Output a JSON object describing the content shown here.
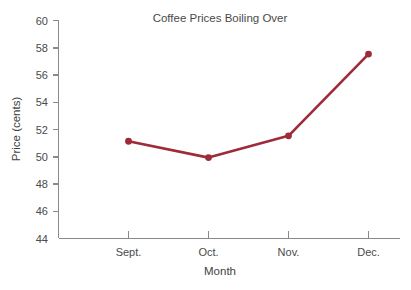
{
  "chart_data": {
    "type": "line",
    "title": "Coffee Prices Boiling Over",
    "xlabel": "Month",
    "ylabel": "Price (cents)",
    "categories": [
      "Sept.",
      "Oct.",
      "Nov.",
      "Dec."
    ],
    "values": [
      51.1,
      49.9,
      51.5,
      57.5
    ],
    "series": [
      {
        "name": "Coffee price",
        "values": [
          51.1,
          49.9,
          51.5,
          57.5
        ]
      }
    ],
    "ylim": [
      44,
      60
    ],
    "ytick_labels": [
      "44",
      "46",
      "48",
      "50",
      "52",
      "54",
      "56",
      "58",
      "60"
    ],
    "ytick_values": [
      44,
      46,
      48,
      50,
      52,
      54,
      56,
      58,
      60
    ],
    "grid": false,
    "legend": "none",
    "marker": "circle",
    "colors": {
      "line": "#9e2b38",
      "marker": "#9e2b38",
      "axis": "#8a8a8a",
      "tick_label": "#4a4a4a",
      "title": "#4a4a4a",
      "axis_title": "#3f3f3f",
      "background": "#ffffff"
    }
  }
}
